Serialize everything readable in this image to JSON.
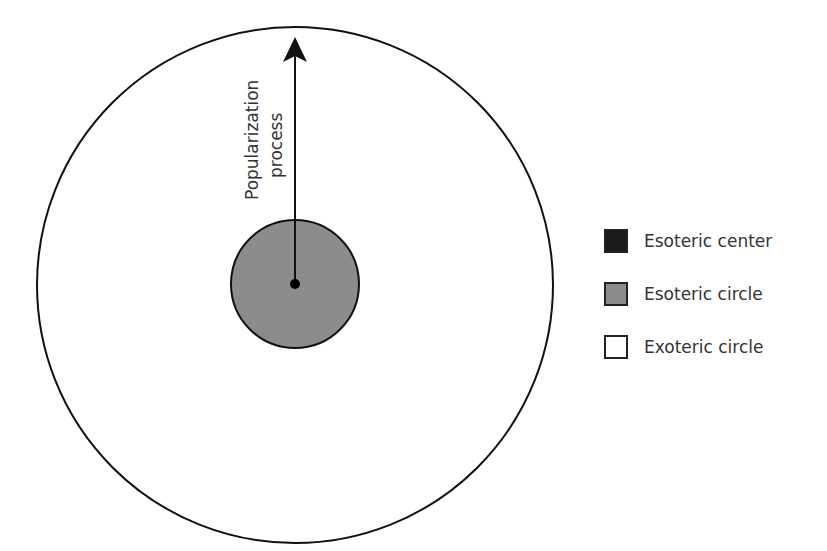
{
  "diagram": {
    "arrow_label_line1": "Popularization",
    "arrow_label_line2": "process",
    "outer_circle": {
      "cx": 295,
      "cy": 285,
      "r": 258,
      "fill": "#ffffff",
      "stroke": "#111111"
    },
    "inner_circle": {
      "cx": 295,
      "cy": 284,
      "r": 64,
      "fill": "#8c8c8c",
      "stroke": "#111111"
    },
    "center_dot": {
      "cx": 295,
      "cy": 284,
      "r": 5,
      "fill": "#000000"
    }
  },
  "legend": {
    "items": [
      {
        "label": "Esoteric center",
        "color": "#1a1a1a"
      },
      {
        "label": "Esoteric circle",
        "color": "#8c8c8c"
      },
      {
        "label": "Exoteric circle",
        "color": "#ffffff"
      }
    ]
  }
}
